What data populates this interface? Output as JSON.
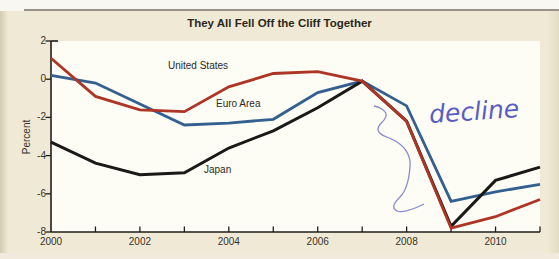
{
  "figure": {
    "title": "They All Fell Off the Cliff Together",
    "annotation": {
      "text": "decline",
      "ink_color": "#7b7ecf"
    }
  },
  "chart_data": {
    "type": "line",
    "title": "They All Fell Off the Cliff Together",
    "xlabel": "",
    "ylabel": "Percent",
    "x": [
      2000,
      2001,
      2002,
      2003,
      2004,
      2005,
      2006,
      2007,
      2008,
      2009,
      2010,
      2011
    ],
    "series": [
      {
        "name": "United States",
        "color": "#ad3526",
        "values": [
          1.1,
          -0.9,
          -1.6,
          -1.7,
          -0.4,
          0.3,
          0.4,
          -0.1,
          -2.2,
          -7.8,
          -7.2,
          -6.3
        ]
      },
      {
        "name": "Euro Area",
        "color": "#33608f",
        "values": [
          0.2,
          -0.2,
          -1.3,
          -2.4,
          -2.3,
          -2.1,
          -0.7,
          -0.1,
          -1.4,
          -6.4,
          -5.9,
          -5.5
        ]
      },
      {
        "name": "Japan",
        "color": "#191918",
        "values": [
          -3.3,
          -4.4,
          -5.0,
          -4.9,
          -3.6,
          -2.7,
          -1.5,
          -0.1,
          -2.2,
          -7.7,
          -5.3,
          -4.6
        ]
      }
    ],
    "xlim": [
      2000,
      2011
    ],
    "ylim": [
      -8,
      2
    ],
    "x_tick_years": [
      2000,
      2002,
      2004,
      2006,
      2008,
      2010
    ],
    "x_tick_labels": [
      "2000",
      "2002",
      "2004",
      "2006",
      "2008",
      "2010"
    ],
    "x_minor_tick_years": [
      2001,
      2002,
      2003,
      2004,
      2005,
      2006,
      2007,
      2008,
      2009,
      2010,
      2011
    ],
    "y_ticks": [
      2,
      0,
      -2,
      -4,
      -6,
      -8
    ],
    "y_tick_labels": [
      "2",
      "0",
      "-2",
      "-4",
      "-6",
      "-8"
    ],
    "grid": false,
    "legend": "inline-labels",
    "annotations": [
      {
        "text": "decline",
        "handwritten": true
      }
    ]
  }
}
